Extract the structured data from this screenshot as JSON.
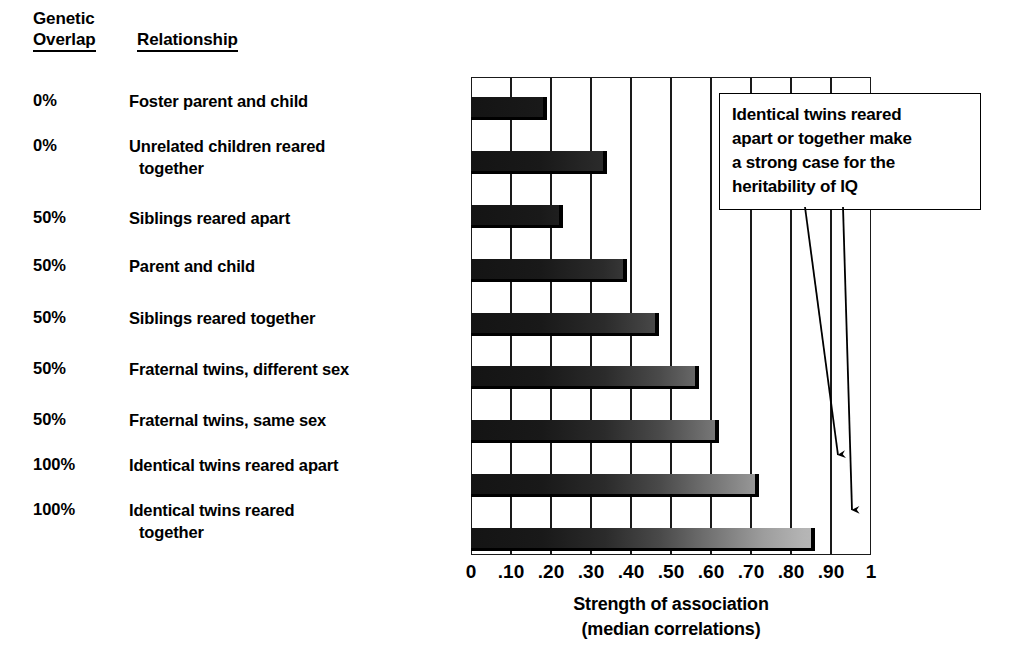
{
  "headers": {
    "genetic_line1": "Genetic",
    "genetic_line2": "Overlap",
    "relationship": "Relationship"
  },
  "rows": [
    {
      "overlap": "0%",
      "relationship": "Foster parent and child",
      "relationship_cont": ""
    },
    {
      "overlap": "0%",
      "relationship": "Unrelated children reared",
      "relationship_cont": "together"
    },
    {
      "overlap": "50%",
      "relationship": "Siblings reared apart",
      "relationship_cont": ""
    },
    {
      "overlap": "50%",
      "relationship": "Parent and child",
      "relationship_cont": ""
    },
    {
      "overlap": "50%",
      "relationship": "Siblings reared together",
      "relationship_cont": ""
    },
    {
      "overlap": "50%",
      "relationship": "Fraternal twins, different sex",
      "relationship_cont": ""
    },
    {
      "overlap": "50%",
      "relationship": "Fraternal twins, same sex",
      "relationship_cont": ""
    },
    {
      "overlap": "100%",
      "relationship": "Identical twins reared apart",
      "relationship_cont": ""
    },
    {
      "overlap": "100%",
      "relationship": "Identical twins reared",
      "relationship_cont": "together"
    }
  ],
  "callout": {
    "line1": "Identical twins reared",
    "line2": "apart or together make",
    "line3": "a strong case for the",
    "line4": "heritability of IQ"
  },
  "axis": {
    "title_line1": "Strength of association",
    "title_line2": "(median correlations)",
    "tick_labels": [
      "0",
      ".10",
      ".20",
      ".30",
      ".40",
      ".50",
      ".60",
      ".70",
      ".80",
      ".90",
      "1"
    ]
  },
  "colors": {
    "ink": "#000000",
    "bar_dark": "#141414",
    "bar_light": "#c2c2c2",
    "background": "#ffffff"
  },
  "chart_data": {
    "type": "bar",
    "orientation": "horizontal",
    "title": "",
    "xlabel": "Strength of association (median correlations)",
    "ylabel": "",
    "xlim": [
      0,
      1
    ],
    "xticks": [
      0,
      0.1,
      0.2,
      0.3,
      0.4,
      0.5,
      0.6,
      0.7,
      0.8,
      0.9,
      1
    ],
    "xticklabels": [
      "0",
      ".10",
      ".20",
      ".30",
      ".40",
      ".50",
      ".60",
      ".70",
      ".80",
      ".90",
      "1"
    ],
    "grid": "vertical",
    "legend": "none",
    "categories": [
      "Foster parent and child",
      "Unrelated children reared together",
      "Siblings reared apart",
      "Parent and child",
      "Siblings reared together",
      "Fraternal twins, different sex",
      "Fraternal twins, same sex",
      "Identical twins reared apart",
      "Identical twins reared together"
    ],
    "values": [
      0.19,
      0.34,
      0.23,
      0.39,
      0.47,
      0.57,
      0.62,
      0.72,
      0.86
    ],
    "group_labels": [
      "0%",
      "0%",
      "50%",
      "50%",
      "50%",
      "50%",
      "50%",
      "100%",
      "100%"
    ],
    "annotations": [
      {
        "text": "Identical twins reared apart or together make a strong case for the heritability of IQ",
        "points_to": [
          "Identical twins reared apart",
          "Identical twins reared together"
        ]
      }
    ]
  }
}
